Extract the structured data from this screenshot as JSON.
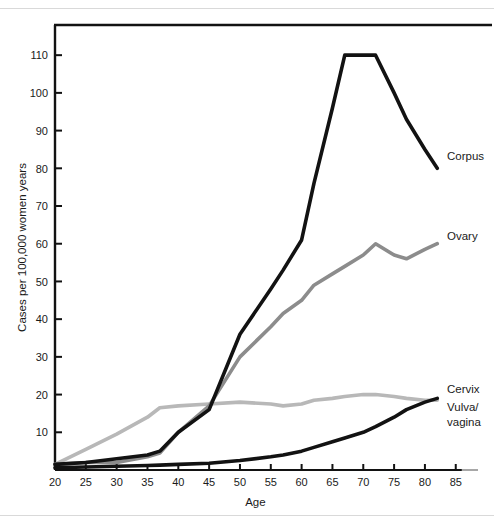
{
  "chart_data": {
    "type": "line",
    "title": "",
    "xlabel": "Age",
    "ylabel": "Cases per 100,000 women years",
    "xlim": [
      20,
      86.5
    ],
    "ylim": [
      0,
      118
    ],
    "xticks": [
      20,
      25,
      30,
      35,
      40,
      45,
      50,
      55,
      60,
      65,
      70,
      75,
      80,
      85
    ],
    "yticks": [
      10,
      20,
      30,
      40,
      50,
      60,
      70,
      80,
      90,
      100,
      110
    ],
    "grid": false,
    "legend_position": "inline-right",
    "x": [
      20,
      25,
      30,
      35,
      37,
      40,
      45,
      50,
      55,
      57,
      60,
      62,
      65,
      67,
      70,
      72,
      75,
      77,
      80,
      82
    ],
    "series": [
      {
        "name": "Corpus",
        "color": "#121212",
        "width": 3.6,
        "label": "Corpus",
        "label_x": 82,
        "label_y": 88,
        "points": [
          [
            20,
            1.5
          ],
          [
            25,
            2.0
          ],
          [
            30,
            3.0
          ],
          [
            35,
            4.0
          ],
          [
            37,
            5.0
          ],
          [
            40,
            10.0
          ],
          [
            45,
            16.0
          ],
          [
            50,
            36.0
          ],
          [
            55,
            48.0
          ],
          [
            57,
            53.0
          ],
          [
            60,
            61.0
          ],
          [
            62,
            76.0
          ],
          [
            65,
            96.0
          ],
          [
            67,
            110.0
          ],
          [
            70,
            110.0
          ],
          [
            72,
            110.0
          ],
          [
            75,
            100.0
          ],
          [
            77,
            93.0
          ],
          [
            80,
            85.0
          ],
          [
            82,
            80.0
          ]
        ]
      },
      {
        "name": "Ovary",
        "color": "#8c8c8c",
        "width": 3.6,
        "label": "Ovary",
        "label_x": 82,
        "label_y": 66,
        "points": [
          [
            20,
            1.5
          ],
          [
            25,
            2.0
          ],
          [
            30,
            2.0
          ],
          [
            35,
            3.5
          ],
          [
            37,
            4.5
          ],
          [
            40,
            10.0
          ],
          [
            45,
            17.0
          ],
          [
            50,
            30.0
          ],
          [
            55,
            38.0
          ],
          [
            57,
            41.5
          ],
          [
            60,
            45.0
          ],
          [
            62,
            49.0
          ],
          [
            65,
            52.0
          ],
          [
            67,
            54.0
          ],
          [
            70,
            57.0
          ],
          [
            72,
            60.0
          ],
          [
            75,
            57.0
          ],
          [
            77,
            56.0
          ],
          [
            80,
            58.5
          ],
          [
            82,
            60.0
          ]
        ]
      },
      {
        "name": "Cervix",
        "color": "#b8b8b8",
        "width": 3.6,
        "label": "Cervix",
        "label_x": 82,
        "label_y": 24,
        "points": [
          [
            20,
            1.5
          ],
          [
            25,
            5.5
          ],
          [
            30,
            9.5
          ],
          [
            35,
            14.0
          ],
          [
            37,
            16.5
          ],
          [
            40,
            17.0
          ],
          [
            45,
            17.5
          ],
          [
            50,
            18.0
          ],
          [
            55,
            17.5
          ],
          [
            57,
            17.0
          ],
          [
            60,
            17.5
          ],
          [
            62,
            18.5
          ],
          [
            65,
            19.0
          ],
          [
            67,
            19.5
          ],
          [
            70,
            20.0
          ],
          [
            72,
            20.0
          ],
          [
            75,
            19.5
          ],
          [
            77,
            19.0
          ],
          [
            80,
            18.5
          ],
          [
            82,
            18.5
          ]
        ]
      },
      {
        "name": "Vulva/vagina",
        "color": "#121212",
        "width": 3.6,
        "label": "Vulva/\nvagina",
        "label_x": 82,
        "label_y": 16,
        "points": [
          [
            20,
            0.6
          ],
          [
            25,
            0.8
          ],
          [
            30,
            1.0
          ],
          [
            35,
            1.2
          ],
          [
            37,
            1.3
          ],
          [
            40,
            1.5
          ],
          [
            45,
            1.8
          ],
          [
            50,
            2.5
          ],
          [
            55,
            3.5
          ],
          [
            57,
            4.0
          ],
          [
            60,
            5.0
          ],
          [
            62,
            6.0
          ],
          [
            65,
            7.5
          ],
          [
            67,
            8.5
          ],
          [
            70,
            10.0
          ],
          [
            72,
            11.5
          ],
          [
            75,
            14.0
          ],
          [
            77,
            16.0
          ],
          [
            80,
            18.0
          ],
          [
            82,
            19.0
          ]
        ]
      }
    ]
  },
  "axis": {
    "y_title": "Cases per 100,000 women years",
    "x_title": "Age",
    "y_tick_labels": [
      "10",
      "20",
      "30",
      "40",
      "50",
      "60",
      "70",
      "80",
      "90",
      "100",
      "110"
    ],
    "x_tick_labels": [
      "20",
      "25",
      "30",
      "35",
      "40",
      "45",
      "50",
      "55",
      "60",
      "65",
      "70",
      "75",
      "80",
      "85"
    ]
  },
  "labels": {
    "corpus": "Corpus",
    "ovary": "Ovary",
    "cervix": "Cervix",
    "vulva_line1": "Vulva/",
    "vulva_line2": "vagina"
  },
  "colors": {
    "corpus": "#121212",
    "ovary": "#8c8c8c",
    "cervix": "#b8b8b8",
    "vulva": "#121212",
    "axis": "#121212",
    "rule": "#d9d9d9",
    "background": "#ffffff"
  }
}
